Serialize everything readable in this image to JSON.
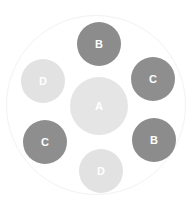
{
  "diagram": {
    "outer_ring": {
      "cx": 96,
      "cy": 105,
      "r": 90,
      "color": "#f2f2f2"
    },
    "center": {
      "label": "A",
      "cx": 99,
      "cy": 106,
      "r": 29,
      "color": "#e5e5e5"
    },
    "nodes": [
      {
        "label": "B",
        "cx": 99,
        "cy": 44,
        "r": 22,
        "color": "#8c8c8c"
      },
      {
        "label": "C",
        "cx": 153,
        "cy": 79,
        "r": 22,
        "color": "#8e8e8e"
      },
      {
        "label": "B",
        "cx": 154,
        "cy": 140,
        "r": 22,
        "color": "#8c8c8c"
      },
      {
        "label": "D",
        "cx": 101,
        "cy": 171,
        "r": 22,
        "color": "#e2e2e2"
      },
      {
        "label": "C",
        "cx": 45,
        "cy": 142,
        "r": 22,
        "color": "#8e8e8e"
      },
      {
        "label": "D",
        "cx": 43,
        "cy": 81,
        "r": 22,
        "color": "#e2e2e2"
      }
    ]
  }
}
